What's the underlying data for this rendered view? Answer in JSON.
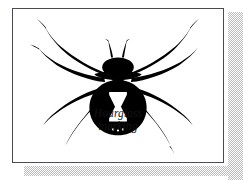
{
  "figure": {
    "caption": {
      "line1": "Hourglass",
      "line2": "marking"
    },
    "colors": {
      "ink": "#000000",
      "paper": "#ffffff",
      "frame_border": "#4a4a52",
      "shadow_halftone": "#b9b9b9",
      "marking_fill": "#ffffff"
    },
    "parts": {
      "abdomen": "spider-abdomen",
      "cephalothorax": "spider-cephalothorax",
      "hourglass": "hourglass-marking",
      "pedipalps": "spider-pedipalps",
      "legs_count": 8
    }
  }
}
